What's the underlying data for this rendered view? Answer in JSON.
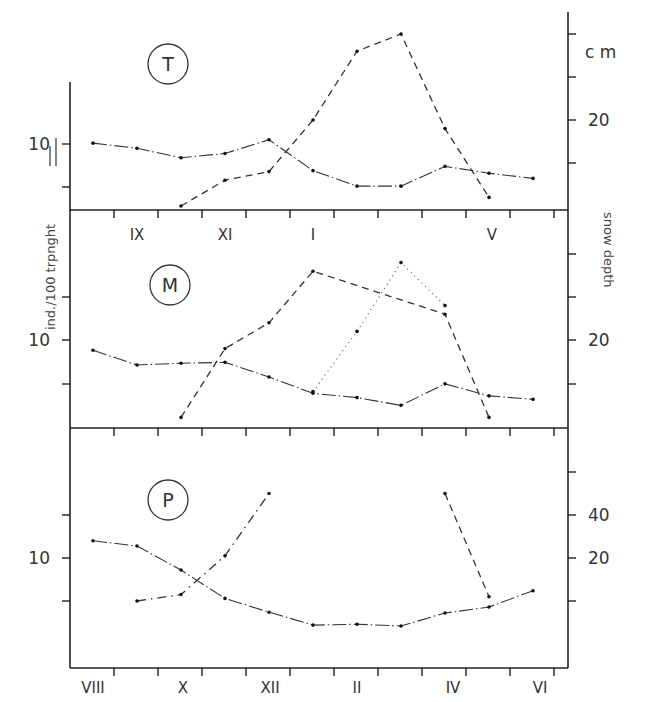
{
  "chart_data": {
    "type": "line",
    "title": "",
    "xlabel": "",
    "ylabel_left": "ind./100 trpnght",
    "ylabel_right": "snow depth",
    "right_unit": "cm",
    "months": [
      "VIII",
      "IX",
      "X",
      "XI",
      "XII",
      "I",
      "II",
      "III",
      "IV",
      "V",
      "VI"
    ],
    "month_labels_top_panel": [
      "IX",
      "XI",
      "I",
      "V"
    ],
    "month_labels_bottom": [
      "VIII",
      "X",
      "XII",
      "II",
      "IV",
      "VI"
    ],
    "legend_marker_abundance": "—|",
    "panels": [
      {
        "label": "T",
        "left_tick_labels": [
          "10"
        ],
        "right_tick_labels": [
          "20"
        ],
        "series": [
          {
            "name": "abundance (ind./100 trapnights)",
            "style": "dash-dot",
            "axis": "left",
            "x": [
              "VIII",
              "IX",
              "X",
              "XI",
              "XII",
              "I",
              "II",
              "III",
              "IV",
              "V",
              "VI"
            ],
            "values": [
              10.1,
              9.5,
              8.4,
              8.9,
              10.5,
              6.9,
              5.1,
              5.1,
              7.4,
              6.6,
              6.0
            ]
          },
          {
            "name": "snow depth (cm)",
            "style": "dashed",
            "axis": "right",
            "x": [
              "X",
              "XI",
              "XII",
              "I",
              "II",
              "III",
              "IV",
              "V"
            ],
            "values": [
              10,
              13,
              14,
              20,
              28,
              30,
              19,
              11
            ]
          }
        ]
      },
      {
        "label": "M",
        "left_tick_labels": [
          "10"
        ],
        "right_tick_labels": [
          "20"
        ],
        "series": [
          {
            "name": "abundance (ind./100 trapnights)",
            "style": "dash-dot",
            "axis": "left",
            "x": [
              "VIII",
              "IX",
              "X",
              "XI",
              "XII",
              "I",
              "II",
              "III",
              "IV",
              "V",
              "VI"
            ],
            "values": [
              8.8,
              7.1,
              7.3,
              7.4,
              5.7,
              3.8,
              3.3,
              2.4,
              4.9,
              3.5,
              3.1
            ]
          },
          {
            "name": "snow depth (cm)",
            "style": "dashed",
            "axis": "right",
            "x": [
              "X",
              "XI",
              "XII",
              "I",
              "IV",
              "V"
            ],
            "values": [
              11,
              19,
              22,
              28,
              23,
              11
            ]
          },
          {
            "name": "snow depth (cm) alt. year",
            "style": "dotted",
            "axis": "right",
            "x": [
              "I",
              "II",
              "III",
              "IV"
            ],
            "values": [
              14,
              21,
              29,
              24
            ]
          }
        ]
      },
      {
        "label": "P",
        "left_tick_labels": [
          "10"
        ],
        "right_tick_labels": [
          "40",
          "20"
        ],
        "series": [
          {
            "name": "abundance (ind./100 trapnights)",
            "style": "dash-dot",
            "axis": "left",
            "x": [
              "VIII",
              "IX",
              "X",
              "XI",
              "XII",
              "I",
              "II",
              "III",
              "IV",
              "V",
              "VI"
            ],
            "values": [
              12.0,
              11.4,
              8.6,
              5.3,
              3.7,
              2.2,
              2.3,
              2.1,
              3.6,
              4.3,
              6.2
            ]
          },
          {
            "name": "snow depth (cm)",
            "style": "dash-dot",
            "axis": "right",
            "x": [
              "IX",
              "X",
              "XI",
              "XII"
            ],
            "values": [
              0,
              3,
              21,
              50
            ]
          },
          {
            "name": "snow depth (cm) descent",
            "style": "dashed",
            "axis": "right",
            "x": [
              "IV",
              "V"
            ],
            "values": [
              50,
              2
            ]
          }
        ]
      }
    ],
    "grid": false,
    "legend_position": "none"
  },
  "labels": {
    "panel_T": "T",
    "panel_M": "M",
    "panel_P": "P",
    "unit_cm": "c m",
    "right_axis_title": "snow  depth",
    "left_axis_title": "ind./100 trpnght",
    "left_ten_T": "10",
    "left_ten_M": "10",
    "left_ten_P": "10",
    "right_twenty_T": "20",
    "right_twenty_M": "20",
    "right_forty_P": "40",
    "right_twenty_P": "20",
    "top_month_IX": "IX",
    "top_month_XI": "XI",
    "top_month_I": "I",
    "top_month_V": "V",
    "bot_month_VIII": "VIII",
    "bot_month_X": "X",
    "bot_month_XII": "XII",
    "bot_month_II": "II",
    "bot_month_IV": "IV",
    "bot_month_VI": "VI"
  }
}
